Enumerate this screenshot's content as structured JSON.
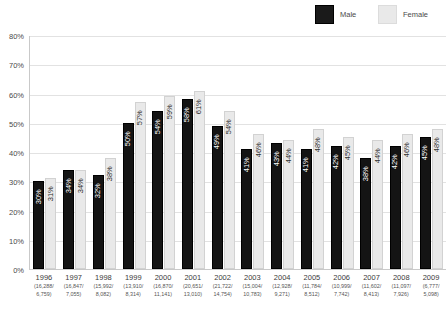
{
  "legend": {
    "male_label": "Male",
    "female_label": "Female",
    "male_color": "#141414",
    "female_color": "#e9e9e9"
  },
  "axis": {
    "y_ticks": [
      "80%",
      "70%",
      "60%",
      "50%",
      "40%",
      "30%",
      "20%",
      "10%",
      "0%"
    ]
  },
  "chart_data": {
    "type": "bar",
    "title": "",
    "subtitle": "",
    "xlabel": "",
    "ylabel": "",
    "ylim": [
      0,
      80
    ],
    "ytick_values": [
      0,
      10,
      20,
      30,
      40,
      50,
      60,
      70,
      80
    ],
    "ytick_labels": [
      "0%",
      "10%",
      "20%",
      "30%",
      "40%",
      "50%",
      "60%",
      "70%",
      "80%"
    ],
    "grid": true,
    "legend_position": "top-right",
    "categories": [
      "1996",
      "1997",
      "1998",
      "1999",
      "2000",
      "2001",
      "2002",
      "2003",
      "2004",
      "2005",
      "2006",
      "2007",
      "2008",
      "2009"
    ],
    "category_sublabels": [
      "(16,288/ 6,759)",
      "(16,847/ 7,055)",
      "(15,992/ 8,082)",
      "(13,910/ 8,314)",
      "(16,870/ 11,141)",
      "(20,651/ 13,010)",
      "(21,722/ 14,754)",
      "(15,004/ 10,783)",
      "(12,928/ 9,271)",
      "(11,784/ 8,512)",
      "(10,999/ 7,742)",
      "(11,602/ 8,413)",
      "(11,097/ 7,926)",
      "(6,777/ 5,098)"
    ],
    "series": [
      {
        "name": "Male",
        "color": "#141414",
        "values": [
          30,
          34,
          32,
          50,
          54,
          58,
          49,
          41,
          43,
          41,
          42,
          38,
          42,
          45
        ],
        "labels": [
          "30%",
          "34%",
          "32%",
          "50%",
          "54%",
          "58%",
          "49%",
          "41%",
          "43%",
          "41%",
          "42%",
          "38%",
          "42%",
          "45%"
        ]
      },
      {
        "name": "Female",
        "color": "#e9e9e9",
        "values": [
          31,
          34,
          38,
          57,
          59,
          61,
          54,
          46,
          44,
          48,
          45,
          44,
          46,
          48
        ],
        "labels": [
          "31%",
          "34%",
          "38%",
          "57%",
          "59%",
          "61%",
          "54%",
          "46%",
          "44%",
          "48%",
          "45%",
          "44%",
          "46%",
          "48%"
        ]
      }
    ],
    "x_counts": [
      {
        "year": "1996",
        "male_n": "16,288",
        "female_n": "6,759"
      },
      {
        "year": "1997",
        "male_n": "16,847",
        "female_n": "7,055"
      },
      {
        "year": "1998",
        "male_n": "15,992",
        "female_n": "8,082"
      },
      {
        "year": "1999",
        "male_n": "13,910",
        "female_n": "8,314"
      },
      {
        "year": "2000",
        "male_n": "16,870",
        "female_n": "11,141"
      },
      {
        "year": "2001",
        "male_n": "20,651",
        "female_n": "13,010"
      },
      {
        "year": "2002",
        "male_n": "21,722",
        "female_n": "14,754"
      },
      {
        "year": "2003",
        "male_n": "15,004",
        "female_n": "10,783"
      },
      {
        "year": "2004",
        "male_n": "12,928",
        "female_n": "9,271"
      },
      {
        "year": "2005",
        "male_n": "11,784",
        "female_n": "8,512"
      },
      {
        "year": "2006",
        "male_n": "10,999",
        "female_n": "7,742"
      },
      {
        "year": "2007",
        "male_n": "11,602",
        "female_n": "8,413"
      },
      {
        "year": "2008",
        "male_n": "11,097",
        "female_n": "7,926"
      },
      {
        "year": "2009",
        "male_n": "6,777",
        "female_n": "5,098"
      }
    ]
  }
}
